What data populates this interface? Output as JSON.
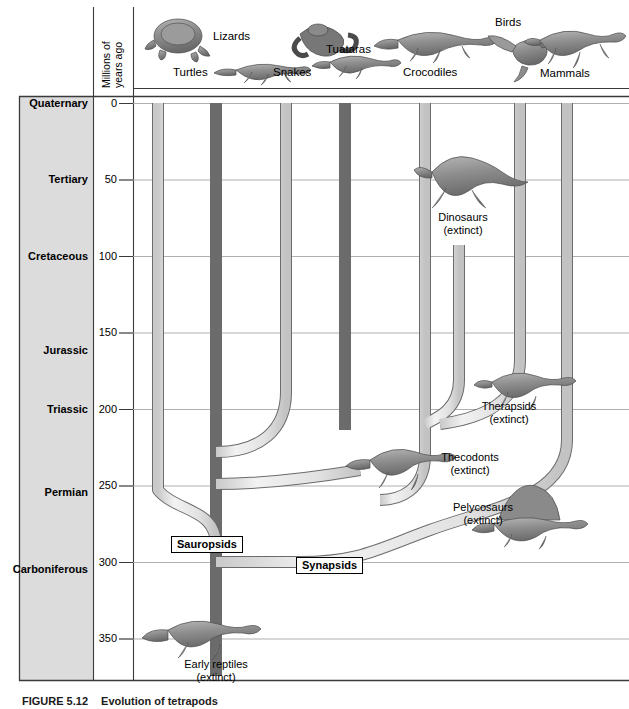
{
  "figure": {
    "caption_number": "FIGURE 5.12",
    "caption_text": "Evolution of tetrapods",
    "axis_title_line1": "Millions of",
    "axis_title_line2": "years ago"
  },
  "colors": {
    "branch_fill": "#e6e6e6",
    "branch_stroke": "#4d4d4d",
    "gridline": "#9a9a9a",
    "frame": "#3a3a3a",
    "period_band": "#dcdcdc",
    "text": "#000000"
  },
  "axis": {
    "label": "Millions of years ago",
    "ticks": [
      {
        "value": "0",
        "my": 0
      },
      {
        "value": "50",
        "my": 50
      },
      {
        "value": "100",
        "my": 100
      },
      {
        "value": "150",
        "my": 150
      },
      {
        "value": "200",
        "my": 200
      },
      {
        "value": "250",
        "my": 250
      },
      {
        "value": "300",
        "my": 300
      },
      {
        "value": "350",
        "my": 350
      }
    ],
    "range_my": [
      0,
      375
    ]
  },
  "periods": [
    {
      "name": "Quaternary",
      "my": 0
    },
    {
      "name": "Tertiary",
      "my": 50
    },
    {
      "name": "Cretaceous",
      "my": 100
    },
    {
      "name": "Jurassic",
      "my": 162
    },
    {
      "name": "Triassic",
      "my": 200
    },
    {
      "name": "Permian",
      "my": 255
    },
    {
      "name": "Carboniferous",
      "my": 305
    }
  ],
  "top_taxa": [
    {
      "name": "Turtles",
      "icon": "turtle-icon",
      "label_x": 173,
      "label_y": 66,
      "art_x": 185,
      "art_y": 42
    },
    {
      "name": "Lizards",
      "icon": "lizard-icon",
      "label_x": 240,
      "label_y": 32,
      "art_x": 248,
      "art_y": 62
    },
    {
      "name": "Snakes",
      "icon": "snake-icon",
      "label_x": 300,
      "label_y": 66,
      "art_x": 313,
      "art_y": 40
    },
    {
      "name": "Tuataras",
      "icon": "tuatara-icon",
      "label_x": 348,
      "label_y": 44,
      "art_x": 358,
      "art_y": 65
    },
    {
      "name": "Crocodiles",
      "icon": "crocodile-icon",
      "label_x": 418,
      "label_y": 66,
      "art_x": 432,
      "art_y": 42
    },
    {
      "name": "Birds",
      "icon": "bird-icon",
      "label_x": 505,
      "label_y": 17,
      "art_x": 515,
      "art_y": 48
    },
    {
      "name": "Mammals",
      "icon": "mammal-icon",
      "label_x": 556,
      "label_y": 69,
      "art_x": 568,
      "art_y": 40
    }
  ],
  "clade_labels": [
    {
      "name": "Sauropsids",
      "x": 171,
      "y": 536
    },
    {
      "name": "Synapsids",
      "x": 296,
      "y": 557
    }
  ],
  "extinct_taxa": [
    {
      "name": "Dinosaurs",
      "status": "(extinct)",
      "x": 441,
      "y": 215,
      "art_x": 452,
      "art_y": 160
    },
    {
      "name": "Therapsids",
      "status": "(extinct)",
      "x": 481,
      "y": 404,
      "art_x": 505,
      "art_y": 372
    },
    {
      "name": "Thecodonts",
      "status": "(extinct)",
      "x": 440,
      "y": 455,
      "art_x": 371,
      "art_y": 455
    },
    {
      "name": "Pelycosaurs",
      "status": "(extinct)",
      "x": 451,
      "y": 504,
      "art_x": 505,
      "art_y": 490
    },
    {
      "name": "Early reptiles",
      "status": "(extinct)",
      "x": 183,
      "y": 662,
      "art_x": 170,
      "art_y": 627
    }
  ],
  "tree": {
    "description": "Phylogenetic tree of amniote evolution showing sauropsid and synapsid lineages branching from early reptiles in the Carboniferous",
    "lineages": [
      {
        "name": "Turtles",
        "tip_x": 158,
        "origin_my": 295
      },
      {
        "name": "Lizards",
        "tip_x": 216,
        "origin_my": 365
      },
      {
        "name": "Snakes",
        "tip_x": 286,
        "origin_my": 172
      },
      {
        "name": "Tuataras",
        "tip_x": 345,
        "origin_my": 248
      },
      {
        "name": "Crocodiles",
        "tip_x": 425,
        "origin_my": 232
      },
      {
        "name": "Dinosaurs",
        "tip_x": 459,
        "origin_my": 92,
        "extinct": true
      },
      {
        "name": "Birds",
        "tip_x": 520,
        "origin_my": 210
      },
      {
        "name": "Mammals",
        "tip_x": 567,
        "origin_my": 300
      }
    ],
    "nodes": [
      {
        "name": "Sauropsid–Synapsid split",
        "my": 305
      },
      {
        "name": "Thecodont radiation",
        "my": 232
      },
      {
        "name": "Archosaur split",
        "my": 210
      },
      {
        "name": "Lepidosaur split",
        "my": 248
      },
      {
        "name": "Squamate split",
        "my": 172
      }
    ]
  }
}
